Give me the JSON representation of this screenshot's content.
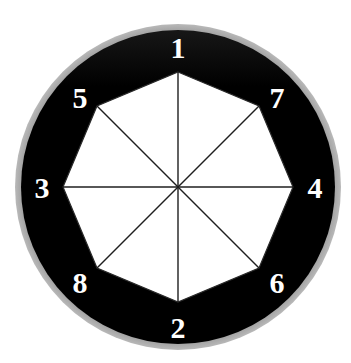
{
  "figure": {
    "type": "geometric-diagram",
    "background_color": "#ffffff",
    "outer_ring_color": "#8c8c8c",
    "disc_color": "#000000",
    "polygon_fill": "#ffffff",
    "spoke_color": "#1a1a1a",
    "label_color": "#ffffff",
    "center": {
      "x": 178,
      "y": 187
    },
    "outer_ring_radius": 163,
    "disc_radius": 157,
    "polygon_radius": 115,
    "label_radius": 140,
    "sides": 8,
    "vertices": [
      {
        "id": "v1",
        "label": "1",
        "angle_deg": 90,
        "x": 178,
        "y": 72,
        "label_x": 178,
        "label_y": 47
      },
      {
        "id": "v7",
        "label": "7",
        "angle_deg": 45,
        "x": 259,
        "y": 106,
        "label_x": 277,
        "label_y": 97
      },
      {
        "id": "v4",
        "label": "4",
        "angle_deg": 0,
        "x": 293,
        "y": 187,
        "label_x": 315,
        "label_y": 187
      },
      {
        "id": "v6",
        "label": "6",
        "angle_deg": -45,
        "x": 259,
        "y": 268,
        "label_x": 277,
        "label_y": 282
      },
      {
        "id": "v2",
        "label": "2",
        "angle_deg": -90,
        "x": 178,
        "y": 302,
        "label_x": 178,
        "label_y": 327
      },
      {
        "id": "v8",
        "label": "8",
        "angle_deg": -135,
        "x": 97,
        "y": 268,
        "label_x": 80,
        "label_y": 282
      },
      {
        "id": "v3",
        "label": "3",
        "angle_deg": 180,
        "x": 63,
        "y": 187,
        "label_x": 42,
        "label_y": 187
      },
      {
        "id": "v5",
        "label": "5",
        "angle_deg": 135,
        "x": 97,
        "y": 106,
        "label_x": 80,
        "label_y": 97
      }
    ],
    "spokes": [
      {
        "from": "center",
        "to": "v1"
      },
      {
        "from": "center",
        "to": "v7"
      },
      {
        "from": "center",
        "to": "v4"
      },
      {
        "from": "center",
        "to": "v6"
      },
      {
        "from": "center",
        "to": "v2"
      },
      {
        "from": "center",
        "to": "v8"
      },
      {
        "from": "center",
        "to": "v3"
      },
      {
        "from": "center",
        "to": "v5"
      }
    ],
    "labels_order": [
      "1",
      "7",
      "4",
      "6",
      "2",
      "8",
      "3",
      "5"
    ]
  }
}
